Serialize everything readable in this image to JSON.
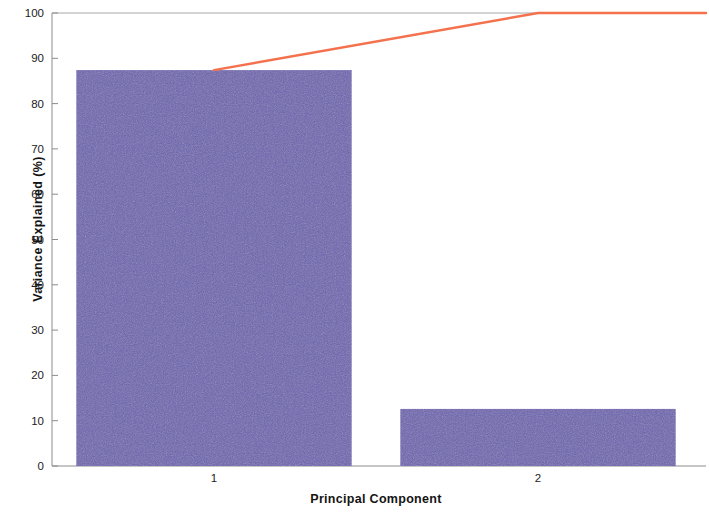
{
  "chart_data": {
    "type": "bar",
    "title": "",
    "subtitle": "",
    "xlabel": "Principal Component",
    "ylabel": "Variance Explained (%)",
    "categories": [
      "1",
      "2"
    ],
    "values": [
      87.4,
      12.6
    ],
    "series": [
      {
        "name": "Variance Explained",
        "type": "bar",
        "values": [
          87.4,
          12.6
        ],
        "color": "#6B61B0"
      },
      {
        "name": "Cumulative Variance",
        "type": "line",
        "values": [
          87.4,
          100
        ],
        "color": "#F4714E"
      }
    ],
    "xlim": [
      0.5,
      2.5
    ],
    "ylim": [
      0,
      100
    ],
    "ytick_labels": [
      "0",
      "10",
      "20",
      "30",
      "40",
      "50",
      "60",
      "70",
      "80",
      "90",
      "100"
    ],
    "ytick_values": [
      0,
      10,
      20,
      30,
      40,
      50,
      60,
      70,
      80,
      90,
      100
    ],
    "xtick_labels": [
      "1",
      "2"
    ],
    "xtick_values": [
      1,
      2
    ],
    "grid": false,
    "legend": "none",
    "bar_color": "#6B61B0",
    "line_color": "#F4714E",
    "axis_color": "#8C8C8C",
    "background_color": "#FFFFFF"
  },
  "axis": {
    "y_title": "Variance Explained (%)",
    "x_title": "Principal Component"
  }
}
